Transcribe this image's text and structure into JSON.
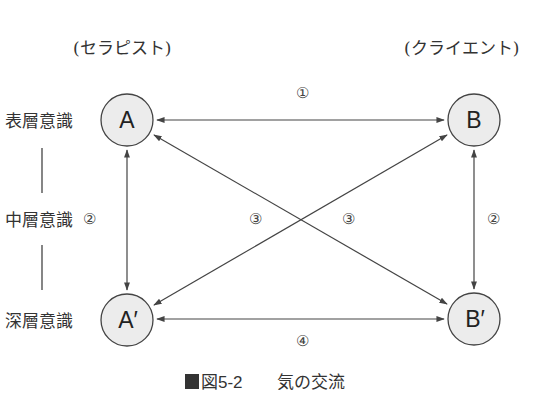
{
  "roles": {
    "therapist": "(セラピスト)",
    "client": "(クライエント)"
  },
  "levels": {
    "surface": "表層意識",
    "middle": "中層意識",
    "deep": "深層意識"
  },
  "nodes": {
    "A": "A",
    "B": "B",
    "A_prime": "A′",
    "B_prime": "B′"
  },
  "flows": {
    "f1": "①",
    "f2_left": "②",
    "f2_right": "②",
    "f3_left": "③",
    "f3_right": "③",
    "f4": "④"
  },
  "caption": {
    "marker": "■",
    "number": "図5-2",
    "title": "気の交流"
  },
  "colors": {
    "node_fill": "#ececec",
    "stroke": "#444444",
    "text": "#333333",
    "caption_marker": "#333333"
  }
}
